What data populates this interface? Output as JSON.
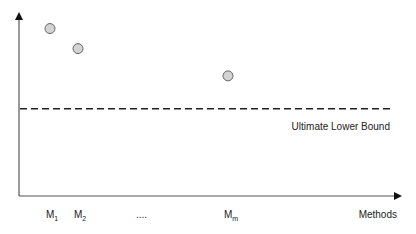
{
  "chart_data": {
    "type": "scatter",
    "title": "",
    "xlabel": "Methods",
    "ylabel": "",
    "categories": [
      "M1",
      "M2",
      "....",
      "Mm"
    ],
    "category_labels": [
      {
        "base": "M",
        "sub": "1"
      },
      {
        "base": "M",
        "sub": "2"
      },
      {
        "base": "....",
        "sub": ""
      },
      {
        "base": "M",
        "sub": "m"
      }
    ],
    "points": [
      {
        "method": "M1",
        "value": 0.92
      },
      {
        "method": "M2",
        "value": 0.81
      },
      {
        "method": "Mm",
        "value": 0.66
      }
    ],
    "reference_line": {
      "label": "Ultimate Lower Bound",
      "value": 0.48,
      "style": "dashed"
    },
    "ylim": [
      0,
      1
    ],
    "grid": false,
    "colors": {
      "point_fill": "#d3d3d3",
      "point_stroke": "#666666",
      "axis": "#333333",
      "line": "#222222"
    }
  }
}
